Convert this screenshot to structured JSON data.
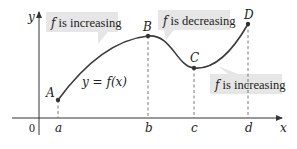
{
  "axes": {
    "x_label": "x",
    "y_label": "y",
    "origin_label": "0",
    "ticks": [
      "a",
      "b",
      "c",
      "d"
    ]
  },
  "curve": {
    "equation_label": "y = f(x)"
  },
  "points": [
    {
      "label": "A"
    },
    {
      "label": "B"
    },
    {
      "label": "C"
    },
    {
      "label": "D"
    }
  ],
  "callouts": [
    {
      "italic": "f",
      "text": " is increasing"
    },
    {
      "italic": "f",
      "text": " is decreasing"
    },
    {
      "italic": "f",
      "text": " is increasing"
    }
  ],
  "colors": {
    "curve": "#3a3a3a",
    "callout_bg": "#e6e6e6",
    "axis": "#333333",
    "guide": "#555555"
  }
}
